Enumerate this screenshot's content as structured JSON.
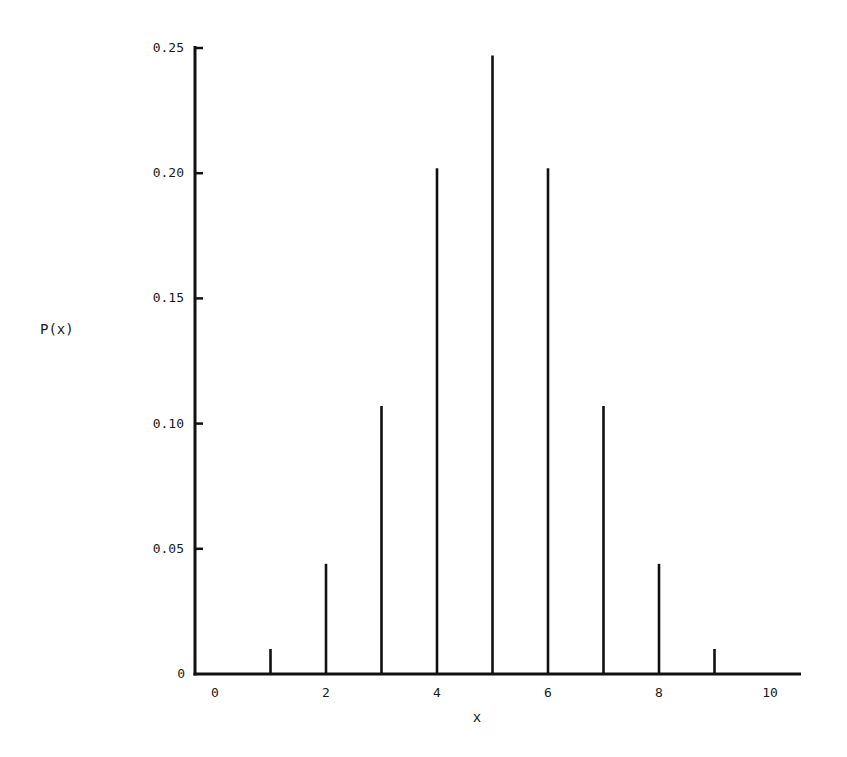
{
  "chart_data": {
    "type": "bar",
    "style": "spike",
    "title": "",
    "xlabel": "x",
    "ylabel": "P(x)",
    "x": [
      1,
      2,
      3,
      4,
      5,
      6,
      7,
      8,
      9
    ],
    "values": [
      0.01,
      0.044,
      0.107,
      0.202,
      0.247,
      0.202,
      0.107,
      0.044,
      0.01
    ],
    "xlim": [
      0,
      10.5
    ],
    "ylim": [
      0,
      0.25
    ],
    "xticks": [
      0,
      2,
      4,
      6,
      8,
      10
    ],
    "xtick_labels": [
      "0",
      "2",
      "4",
      "6",
      "8",
      "10"
    ],
    "yticks": [
      0,
      0.05,
      0.1,
      0.15,
      0.2,
      0.25
    ],
    "ytick_labels": [
      "0",
      "0.05",
      "0.10",
      "0.15",
      "0.20",
      "0.25"
    ],
    "grid": false,
    "legend": null,
    "colors": {
      "bars": "#111111",
      "axes": "#111111",
      "text": "#1a1a1a"
    }
  }
}
